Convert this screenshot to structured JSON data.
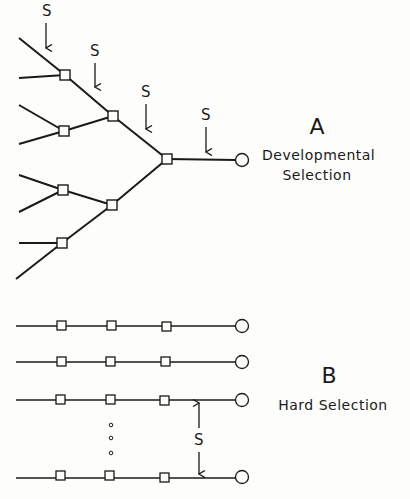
{
  "panel_a": {
    "letter": "A",
    "title_line1": "Developmental",
    "title_line2": "Selection",
    "selection_marker": "S",
    "selection_arrow_count": 4
  },
  "panel_b": {
    "letter": "B",
    "title": "Hard Selection",
    "selection_marker": "S",
    "row_count_visible": 4,
    "ellipsis": "vertical dots (more rows)"
  },
  "legend": {
    "square": "intermediate node",
    "circle": "terminal endpoint"
  },
  "colors": {
    "ink": "#1a1a1a",
    "background": "#fdfdfc"
  }
}
